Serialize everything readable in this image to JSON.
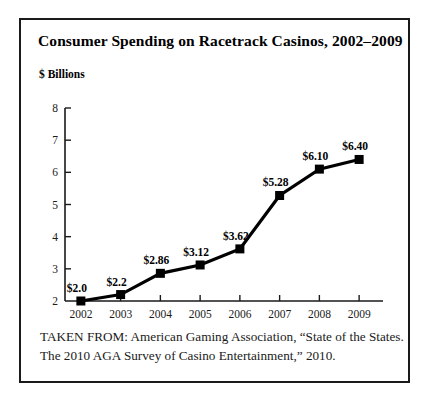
{
  "figure": {
    "title": "Consumer Spending on Racetrack Casinos, 2002–2009",
    "source_line_1": "TAKEN FROM: American Gaming Association, “State of the States.",
    "source_line_2": "The 2010 AGA Survey of Casino Entertainment,” 2010.",
    "border_color": "#1a1a1a",
    "background_color": "#ffffff"
  },
  "chart_data": {
    "type": "line",
    "title": "Consumer Spending on Racetrack Casinos, 2002–2009",
    "xlabel": "",
    "ylabel": "$ Billions",
    "categories": [
      "2002",
      "2003",
      "2004",
      "2005",
      "2006",
      "2007",
      "2008",
      "2009"
    ],
    "values": [
      2.0,
      2.2,
      2.86,
      3.12,
      3.62,
      5.28,
      6.1,
      6.4
    ],
    "point_labels": [
      "$2.0",
      "$2.2",
      "$2.86",
      "$3.12",
      "$3.62",
      "$5.28",
      "$6.10",
      "$6.40"
    ],
    "ylim": [
      2,
      8
    ],
    "yticks": [
      2,
      3,
      4,
      5,
      6,
      7,
      8
    ],
    "ytick_labels": [
      "2",
      "3",
      "4",
      "5",
      "6",
      "7",
      "8"
    ],
    "grid": false,
    "legend": false,
    "series_color": "#000000",
    "marker": "square"
  }
}
